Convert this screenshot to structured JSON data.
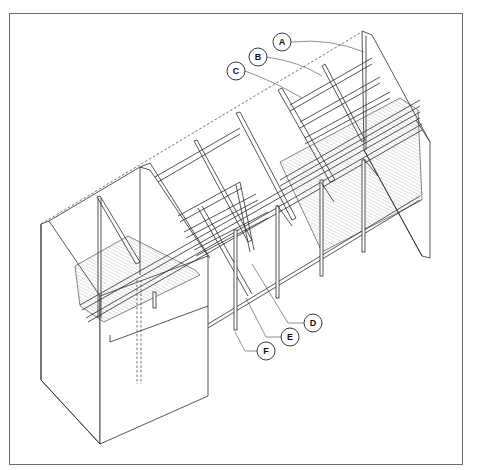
{
  "diagram": {
    "type": "isometric architectural section drawing",
    "colors": {
      "background": "#ffffff",
      "line": "#2a2a2a",
      "frame": "#6e6e6e"
    },
    "callouts": [
      {
        "id": "A",
        "label": "A",
        "x": 282,
        "y": 42
      },
      {
        "id": "B",
        "label": "B",
        "x": 258,
        "y": 57
      },
      {
        "id": "C",
        "label": "C",
        "x": 236,
        "y": 71
      },
      {
        "id": "D",
        "label": "D",
        "x": 313,
        "y": 323
      },
      {
        "id": "E",
        "label": "E",
        "x": 290,
        "y": 337
      },
      {
        "id": "F",
        "label": "F",
        "x": 266,
        "y": 351
      }
    ]
  }
}
